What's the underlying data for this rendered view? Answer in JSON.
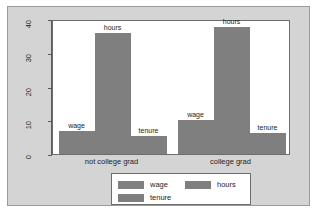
{
  "chart_data": {
    "type": "bar",
    "title": "",
    "subtitle": "",
    "xlabel": "",
    "ylabel": "",
    "categories": [
      "not college grad",
      "college grad"
    ],
    "series": [
      {
        "name": "wage",
        "values": [
          6.7,
          10.2
        ],
        "color": "#7f7f7f"
      },
      {
        "name": "hours",
        "values": [
          36.0,
          37.5
        ],
        "color": "#7f7f7f"
      },
      {
        "name": "tenure",
        "values": [
          5.3,
          6.3
        ],
        "color": "#7f7f7f"
      }
    ],
    "ylim": [
      0,
      40
    ],
    "yticks": [
      0,
      10,
      20,
      30,
      40
    ],
    "ytick_labels": [
      "0",
      "10",
      "20",
      "30",
      "40"
    ],
    "grid": false,
    "legend_position": "bottom",
    "bar_value_labels": [
      {
        "group": "not college grad",
        "series": "wage",
        "text": "wage"
      },
      {
        "group": "not college grad",
        "series": "hours",
        "text": "hours"
      },
      {
        "group": "not college grad",
        "series": "tenure",
        "text": "tenure"
      },
      {
        "group": "college grad",
        "series": "wage",
        "text": "wage"
      },
      {
        "group": "college grad",
        "series": "hours",
        "text": "hours"
      },
      {
        "group": "college grad",
        "series": "tenure",
        "text": "tenure"
      }
    ]
  },
  "axes": {
    "y_ticks": [
      {
        "value": 40,
        "label": "40"
      },
      {
        "value": 30,
        "label": "30"
      },
      {
        "value": 20,
        "label": "20"
      },
      {
        "value": 10,
        "label": "10"
      },
      {
        "value": 0,
        "label": "0"
      }
    ],
    "x_categories": [
      {
        "label": "not college grad"
      },
      {
        "label": "college grad"
      }
    ]
  },
  "legend": {
    "entries": [
      {
        "label": "wage",
        "color": "#7f7f7f"
      },
      {
        "label": "hours",
        "color": "#7f7f7f"
      },
      {
        "label": "tenure",
        "color": "#7f7f7f"
      }
    ]
  },
  "colors": {
    "bar": "#7f7f7f",
    "panel_background": "#ffffff",
    "figure_background": "#d4d4d4",
    "axis": "#5a5a5a",
    "border": "#6d6d6d",
    "text": "#1c1c1c"
  }
}
